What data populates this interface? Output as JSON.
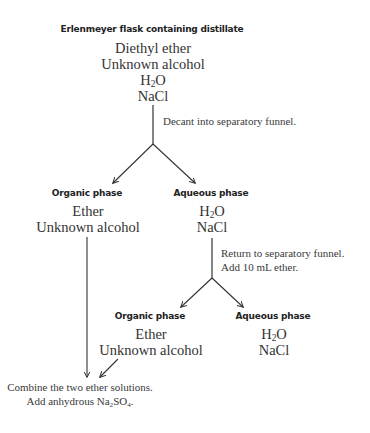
{
  "start": {
    "title": "Erlenmeyer flask containing distillate",
    "components": [
      "Diethyl ether",
      "Unknown alcohol",
      "H2O",
      "NaCl"
    ]
  },
  "step1": {
    "instruction": "Decant into separatory funnel."
  },
  "split1": {
    "organic": {
      "title": "Organic phase",
      "components": [
        "Ether",
        "Unknown alcohol"
      ]
    },
    "aqueous": {
      "title": "Aqueous phase",
      "components": [
        "H2O",
        "NaCl"
      ]
    }
  },
  "step2": {
    "instruction_lines": [
      "Return to separatory funnel.",
      "Add 10 mL ether."
    ]
  },
  "split2": {
    "organic": {
      "title": "Organic phase",
      "components": [
        "Ether",
        "Unknown alcohol"
      ]
    },
    "aqueous": {
      "title": "Aqueous phase",
      "components": [
        "H2O",
        "NaCl"
      ]
    }
  },
  "final": {
    "instruction_lines": [
      "Combine the two ether solutions.",
      "Add anhydrous Na2SO4."
    ]
  },
  "formula_parts": {
    "h": "H",
    "two": "2",
    "o": "O",
    "na": "Na",
    "so": "SO",
    "four": "4",
    "period": "."
  },
  "colors": {
    "text": "#2a2a2a",
    "lines": "#333333",
    "background": "#ffffff"
  }
}
